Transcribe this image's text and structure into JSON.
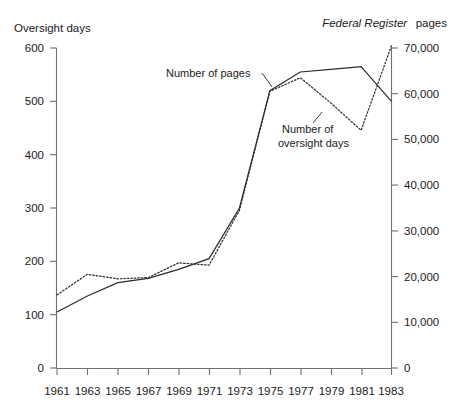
{
  "chart_data": {
    "type": "line",
    "title": "",
    "xlabel": "",
    "ylabel": "Oversight days",
    "y2label": "Federal Register pages",
    "y2label_italic_part": "Federal Register",
    "y2label_plain_part": "pages",
    "grid": false,
    "legend_position": "inline-annotations",
    "x": [
      1961,
      1962,
      1963,
      1964,
      1965,
      1966,
      1967,
      1968,
      1969,
      1970,
      1971,
      1972,
      1973,
      1974,
      1975,
      1976,
      1977,
      1978,
      1979,
      1980,
      1981,
      1982,
      1983
    ],
    "xtick_labels": [
      "1961",
      "1963",
      "1965",
      "1967",
      "1969",
      "1971",
      "1973",
      "1975",
      "1977",
      "1979",
      "1981",
      "1983"
    ],
    "xtick_values": [
      1961,
      1963,
      1965,
      1967,
      1969,
      1971,
      1973,
      1975,
      1977,
      1979,
      1981,
      1983
    ],
    "xlim": [
      1961,
      1983
    ],
    "ylim": [
      0,
      600
    ],
    "ytick_labels": [
      "0",
      "100",
      "200",
      "300",
      "400",
      "500",
      "600"
    ],
    "ytick_values": [
      0,
      100,
      200,
      300,
      400,
      500,
      600
    ],
    "y2lim": [
      0,
      70000
    ],
    "y2tick_labels": [
      "0",
      "10,000",
      "20,000",
      "30,000",
      "40,000",
      "50,000",
      "60,000",
      "70,000"
    ],
    "y2tick_values": [
      0,
      10000,
      20000,
      30000,
      40000,
      50000,
      60000,
      70000
    ],
    "series": [
      {
        "name": "Number of oversight days",
        "axis": "left",
        "style": "solid",
        "color": "#2b2b2b",
        "label": "Number of oversight days",
        "x": [
          1961,
          1963,
          1965,
          1967,
          1969,
          1971,
          1973,
          1975,
          1977,
          1979,
          1981,
          1983
        ],
        "values": [
          105,
          135,
          160,
          168,
          185,
          205,
          300,
          520,
          555,
          560,
          565,
          500
        ]
      },
      {
        "name": "Number of pages",
        "axis": "right",
        "style": "dotted",
        "color": "#2b2b2b",
        "label": "Number of pages",
        "x": [
          1961,
          1963,
          1965,
          1967,
          1969,
          1971,
          1973,
          1975,
          1977,
          1979,
          1981,
          1983
        ],
        "values": [
          16000,
          20500,
          19500,
          19800,
          23000,
          22500,
          34500,
          60500,
          63500,
          58000,
          52000,
          70500
        ]
      }
    ],
    "annotations": [
      {
        "name": "pages-annotation",
        "text": "Number of pages",
        "lines": [
          "Number of pages"
        ],
        "target_series": "Number of pages"
      },
      {
        "name": "oversight-days-annotation",
        "text": "Number of oversight days",
        "lines": [
          "Number of",
          "oversight days"
        ],
        "target_series": "Number of oversight days"
      }
    ]
  }
}
